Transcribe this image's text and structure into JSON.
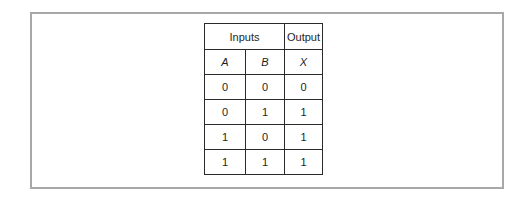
{
  "truth_table": {
    "group_headers": {
      "inputs": "Inputs",
      "output": "Output"
    },
    "columns": [
      "A",
      "B",
      "X"
    ],
    "rows": [
      [
        "0",
        "0",
        "0"
      ],
      [
        "0",
        "1",
        "1"
      ],
      [
        "1",
        "0",
        "1"
      ],
      [
        "1",
        "1",
        "1"
      ]
    ]
  }
}
